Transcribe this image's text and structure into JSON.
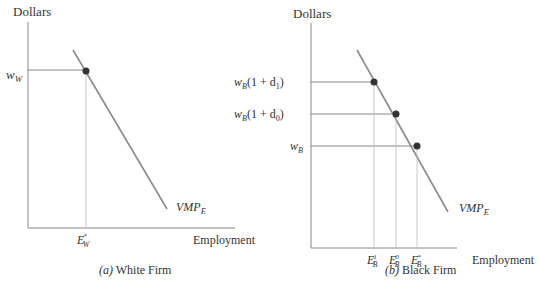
{
  "panels": [
    {
      "id": "a",
      "caption_letter": "(a)",
      "caption_text": " White Firm",
      "y_axis_label": "Dollars",
      "x_axis_label": "Employment",
      "curve_label": "VMP",
      "curve_label_sub": "E",
      "wage_labels": [
        {
          "base": "w",
          "sub": "W",
          "suffix": ""
        }
      ],
      "employment_labels": [
        {
          "base": "E",
          "sub": "W",
          "sup": "*"
        }
      ]
    },
    {
      "id": "b",
      "caption_letter": "(b)",
      "caption_text": " Black Firm",
      "y_axis_label": "Dollars",
      "x_axis_label": "Employment",
      "curve_label": "VMP",
      "curve_label_sub": "E",
      "wage_labels": [
        {
          "base": "w",
          "sub": "B",
          "suffix": "(1 + d",
          "suffix_sub": "1",
          "close": ")"
        },
        {
          "base": "w",
          "sub": "B",
          "suffix": "(1 + d",
          "suffix_sub": "0",
          "close": ")"
        },
        {
          "base": "w",
          "sub": "B",
          "suffix": ""
        }
      ],
      "employment_labels": [
        {
          "base": "E",
          "sub": "B",
          "sup": "1"
        },
        {
          "base": "E",
          "sub": "B",
          "sup": "0"
        },
        {
          "base": "E",
          "sub": "B",
          "sup": "*"
        }
      ]
    }
  ],
  "colors": {
    "axis": "#777777",
    "curve": "#8a8a8a",
    "guide": "#999999",
    "dot": "#333333",
    "text": "#333333"
  }
}
